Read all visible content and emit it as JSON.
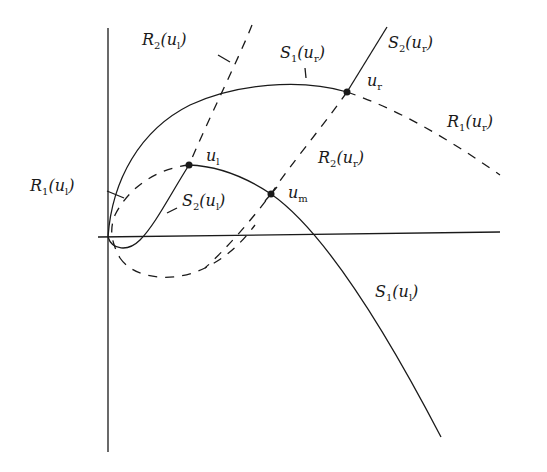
{
  "figure": {
    "type": "wave-curve diagram (Riemann problem, u_l / u_r states)",
    "axes": {
      "horizontal": true,
      "vertical": true,
      "tick_labels": []
    },
    "points": [
      {
        "id": "u_l",
        "label": "u",
        "sub": "l"
      },
      {
        "id": "u_r",
        "label": "u",
        "sub": "r"
      },
      {
        "id": "u_m",
        "label": "u",
        "sub": "m"
      }
    ],
    "curve_labels": {
      "R2_ul": {
        "family": "R",
        "index": "2",
        "arg": "u",
        "argsub": "l"
      },
      "S1_ur": {
        "family": "S",
        "index": "1",
        "arg": "u",
        "argsub": "r"
      },
      "S2_ur": {
        "family": "S",
        "index": "2",
        "arg": "u",
        "argsub": "r"
      },
      "R1_ur": {
        "family": "R",
        "index": "1",
        "arg": "u",
        "argsub": "r"
      },
      "R2_ur": {
        "family": "R",
        "index": "2",
        "arg": "u",
        "argsub": "r"
      },
      "R1_ul": {
        "family": "R",
        "index": "1",
        "arg": "u",
        "argsub": "l"
      },
      "S2_ul": {
        "family": "S",
        "index": "2",
        "arg": "u",
        "argsub": "l"
      },
      "S1_ul": {
        "family": "S",
        "index": "1",
        "arg": "u",
        "argsub": "l"
      }
    },
    "line_styles": {
      "shock": "solid",
      "rarefaction": "dashed"
    }
  }
}
